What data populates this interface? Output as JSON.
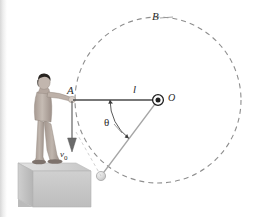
{
  "figure": {
    "background_color": "#ffffff",
    "width": 261,
    "height": 217
  },
  "labels": {
    "point_a": "A",
    "point_b": "B",
    "pivot_o": "O",
    "length_l": "l",
    "angle_theta": "θ",
    "velocity": "v",
    "velocity_subscript": "0"
  },
  "geometry": {
    "pivot": {
      "x": 158,
      "y": 100,
      "name": "pivot-point-O"
    },
    "point_a": {
      "x": 75,
      "y": 100,
      "name": "point-A"
    },
    "point_b": {
      "x": 163,
      "y": 22,
      "name": "point-B"
    },
    "ball": {
      "x": 101,
      "y": 176,
      "radius": 4.5,
      "name": "swinging-ball"
    },
    "radius": 83,
    "rod_line": {
      "x1": 75,
      "y1": 100,
      "x2": 158,
      "y2": 100
    },
    "string_line": {
      "x1": 158,
      "y1": 100,
      "x2": 101,
      "y2": 176
    },
    "angle_arc_degrees": 53,
    "dashed_circle": {
      "cx": 158,
      "cy": 100,
      "r": 83
    }
  },
  "colors": {
    "line_dark": "#3a3a3a",
    "line_gray": "#9a9a9a",
    "dash_gray": "#8c8c8c",
    "ball_fill": "#dcdcdc",
    "pedestal_top": "#d4d4d4",
    "pedestal_face": "#c2c2c2",
    "person_skin": "#b8aca4",
    "person_hair": "#2e2a28",
    "edge_shadow": "#d8d8d8"
  },
  "elements": {
    "person": "human-figure-standing-on-pedestal",
    "pedestal": "gray-platform-block",
    "velocity_arrow": "downward-velocity-arrow",
    "dashed_trajectory": "dashed-circular-path",
    "angle_indicator": "angle-arc-theta",
    "rod": "horizontal-rod-A-to-O",
    "string": "string-from-O-to-ball"
  }
}
